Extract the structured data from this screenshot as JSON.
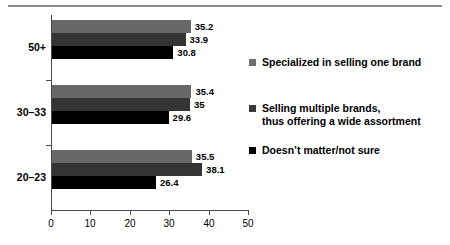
{
  "chart_data": {
    "type": "bar",
    "orientation": "horizontal",
    "title": "",
    "subtitle": "",
    "xlabel": "",
    "ylabel": "",
    "xlim": [
      0,
      50
    ],
    "xticks": [
      "0",
      "10",
      "20",
      "30",
      "40",
      "50"
    ],
    "grid": false,
    "legend_position": "right",
    "categories": [
      "50+",
      "30–33",
      "20–23"
    ],
    "series": [
      {
        "name": "Specialized in selling one brand",
        "color": "#686868",
        "values": [
          35.2,
          35.4,
          35.5
        ],
        "labels": [
          "35.2",
          "35.4",
          "35.5"
        ]
      },
      {
        "name": "Selling multiple brands, thus offering a wide assortment",
        "name_line1": "Selling multiple brands,",
        "name_line2": "thus offering a wide assortment",
        "color": "#343434",
        "values": [
          33.9,
          35,
          38.1
        ],
        "labels": [
          "33.9",
          "35",
          "38.1"
        ]
      },
      {
        "name": "Doesn’t matter/not sure",
        "color": "#000000",
        "values": [
          30.8,
          29.6,
          26.4
        ],
        "labels": [
          "30.8",
          "29.6",
          "26.4"
        ]
      }
    ]
  },
  "axis": {
    "ticks": [
      {
        "label": "0"
      },
      {
        "label": "10"
      },
      {
        "label": "20"
      },
      {
        "label": "30"
      },
      {
        "label": "40"
      },
      {
        "label": "50"
      }
    ]
  },
  "legend": {
    "items": [
      {
        "label": "Specialized in selling one brand",
        "line2": ""
      },
      {
        "label": "Selling multiple brands,",
        "line2": "thus offering a wide assortment"
      },
      {
        "label": "Doesn’t matter/not sure",
        "line2": ""
      }
    ]
  }
}
